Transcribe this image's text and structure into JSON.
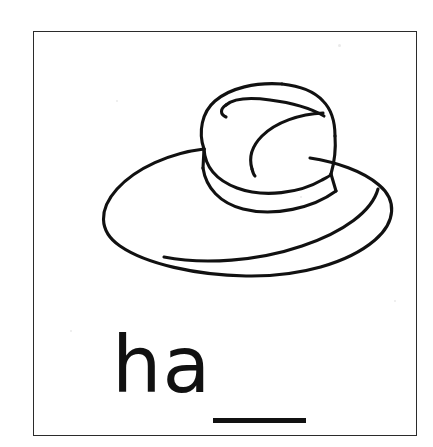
{
  "card": {
    "type": "phonics-worksheet-card",
    "background_color": "#ffffff",
    "border_color": "#2b2b2b",
    "ink_color": "#111111",
    "border": {
      "x": 33,
      "y": 31,
      "width": 384,
      "height": 405
    }
  },
  "illustration": {
    "name": "hat-line-drawing",
    "subject": "hat",
    "style": "black outline coloring page",
    "alt_text": "Line drawing of a fedora hat with a wide brim, creased crown and hat band",
    "stroke_color": "#111111",
    "fill_color": "#ffffff",
    "parts": [
      "brim",
      "crown",
      "hat-band",
      "crown-crease"
    ]
  },
  "word_prompt": {
    "letters": "ha",
    "blank_label": "blank-line",
    "full_prompt": "ha___",
    "answer_slots": 1
  },
  "speckles": [
    {
      "x": 338,
      "y": 44,
      "size": 3
    },
    {
      "x": 300,
      "y": 196,
      "size": 2
    },
    {
      "x": 116,
      "y": 100,
      "size": 2
    },
    {
      "x": 70,
      "y": 330,
      "size": 2
    },
    {
      "x": 394,
      "y": 300,
      "size": 2
    }
  ]
}
